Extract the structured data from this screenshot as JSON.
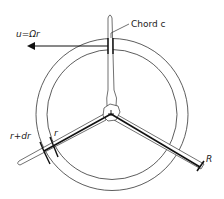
{
  "diagram": {
    "labels": {
      "velocity": "u=Ωr",
      "chord": "Chord c",
      "outer_radius": "r+dr",
      "inner_radius": "r",
      "tip_radius": "R"
    },
    "colors": {
      "line": "#222222",
      "background": "#ffffff"
    }
  }
}
